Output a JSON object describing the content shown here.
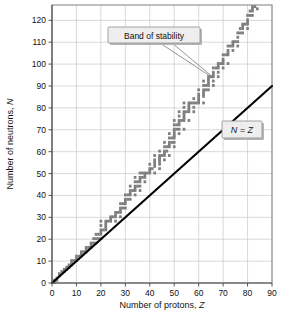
{
  "figure": {
    "background_color": "#ffffff",
    "plot_area": {
      "left": 52,
      "top": 5,
      "right": 272,
      "bottom": 283
    }
  },
  "chart_data": {
    "type": "scatter",
    "title": "",
    "xlabel_prefix": "Number of protons, ",
    "xlabel_symbol": "Z",
    "ylabel_prefix": "Number of neutrons, ",
    "ylabel_symbol": "N",
    "xlim": [
      0,
      90
    ],
    "ylim": [
      0,
      127
    ],
    "xticks": [
      0,
      10,
      20,
      30,
      40,
      50,
      60,
      70,
      80,
      90
    ],
    "yticks": [
      0,
      10,
      20,
      30,
      40,
      50,
      60,
      70,
      80,
      90,
      100,
      110,
      120
    ],
    "xtick_labels": [
      "0",
      "10",
      "20",
      "30",
      "40",
      "50",
      "60",
      "70",
      "80",
      "90"
    ],
    "ytick_labels": [
      "0",
      "10",
      "20",
      "30",
      "40",
      "50",
      "60",
      "70",
      "80",
      "90",
      "100",
      "110",
      "120"
    ],
    "grid": true,
    "grid_color": "#c9c9c9",
    "legend_position": "none",
    "annotations": [
      {
        "name": "band-of-stability-callout",
        "text": "Band of stability",
        "box_x": 108,
        "box_y": 27,
        "box_w": 92,
        "box_h": 16,
        "leader_from_x": 165,
        "leader_from_y": 43,
        "leader_to_x": 212,
        "leader_to_y": 77
      },
      {
        "name": "n-equals-z-label",
        "text": "N = Z",
        "box_x": 222,
        "box_y": 121,
        "box_w": 40,
        "box_h": 17
      }
    ],
    "series": [
      {
        "name": "N = Z line",
        "type": "line",
        "color": "#000000",
        "points": [
          [
            0,
            0
          ],
          [
            90,
            90
          ]
        ]
      },
      {
        "name": "Band of stability",
        "type": "scatter",
        "color": "#7f7f7f",
        "description": "Stable nuclides: central stepped band of (Z, N) pairs rising above the N=Z line as Z increases.",
        "points": [
          [
            1,
            0
          ],
          [
            1,
            1
          ],
          [
            2,
            1
          ],
          [
            2,
            2
          ],
          [
            3,
            3
          ],
          [
            3,
            4
          ],
          [
            4,
            5
          ],
          [
            5,
            5
          ],
          [
            5,
            6
          ],
          [
            6,
            6
          ],
          [
            6,
            7
          ],
          [
            7,
            7
          ],
          [
            7,
            8
          ],
          [
            8,
            8
          ],
          [
            8,
            9
          ],
          [
            8,
            10
          ],
          [
            9,
            10
          ],
          [
            10,
            10
          ],
          [
            10,
            11
          ],
          [
            10,
            12
          ],
          [
            11,
            12
          ],
          [
            12,
            12
          ],
          [
            12,
            13
          ],
          [
            12,
            14
          ],
          [
            13,
            14
          ],
          [
            14,
            14
          ],
          [
            14,
            15
          ],
          [
            14,
            16
          ],
          [
            15,
            16
          ],
          [
            16,
            16
          ],
          [
            16,
            17
          ],
          [
            16,
            18
          ],
          [
            17,
            18
          ],
          [
            17,
            20
          ],
          [
            18,
            18
          ],
          [
            18,
            20
          ],
          [
            18,
            22
          ],
          [
            19,
            20
          ],
          [
            19,
            22
          ],
          [
            20,
            20
          ],
          [
            20,
            22
          ],
          [
            20,
            23
          ],
          [
            20,
            24
          ],
          [
            20,
            26
          ],
          [
            20,
            28
          ],
          [
            21,
            24
          ],
          [
            22,
            24
          ],
          [
            22,
            25
          ],
          [
            22,
            26
          ],
          [
            22,
            27
          ],
          [
            22,
            28
          ],
          [
            23,
            28
          ],
          [
            24,
            28
          ],
          [
            24,
            29
          ],
          [
            24,
            30
          ],
          [
            25,
            30
          ],
          [
            26,
            28
          ],
          [
            26,
            30
          ],
          [
            26,
            31
          ],
          [
            26,
            32
          ],
          [
            27,
            32
          ],
          [
            28,
            30
          ],
          [
            28,
            32
          ],
          [
            28,
            33
          ],
          [
            28,
            34
          ],
          [
            28,
            36
          ],
          [
            29,
            34
          ],
          [
            29,
            36
          ],
          [
            30,
            34
          ],
          [
            30,
            36
          ],
          [
            30,
            37
          ],
          [
            30,
            38
          ],
          [
            30,
            40
          ],
          [
            31,
            38
          ],
          [
            31,
            40
          ],
          [
            32,
            38
          ],
          [
            32,
            40
          ],
          [
            32,
            41
          ],
          [
            32,
            42
          ],
          [
            32,
            44
          ],
          [
            33,
            42
          ],
          [
            34,
            40
          ],
          [
            34,
            42
          ],
          [
            34,
            43
          ],
          [
            34,
            44
          ],
          [
            34,
            46
          ],
          [
            34,
            48
          ],
          [
            35,
            44
          ],
          [
            35,
            46
          ],
          [
            36,
            42
          ],
          [
            36,
            44
          ],
          [
            36,
            46
          ],
          [
            36,
            47
          ],
          [
            36,
            48
          ],
          [
            36,
            50
          ],
          [
            37,
            48
          ],
          [
            37,
            50
          ],
          [
            38,
            46
          ],
          [
            38,
            48
          ],
          [
            38,
            49
          ],
          [
            38,
            50
          ],
          [
            39,
            50
          ],
          [
            40,
            50
          ],
          [
            40,
            51
          ],
          [
            40,
            52
          ],
          [
            40,
            54
          ],
          [
            41,
            52
          ],
          [
            42,
            50
          ],
          [
            42,
            53
          ],
          [
            42,
            54
          ],
          [
            42,
            55
          ],
          [
            42,
            56
          ],
          [
            42,
            58
          ],
          [
            44,
            52
          ],
          [
            44,
            54
          ],
          [
            44,
            55
          ],
          [
            44,
            56
          ],
          [
            44,
            57
          ],
          [
            44,
            58
          ],
          [
            44,
            60
          ],
          [
            45,
            58
          ],
          [
            46,
            56
          ],
          [
            46,
            58
          ],
          [
            46,
            59
          ],
          [
            46,
            60
          ],
          [
            46,
            62
          ],
          [
            46,
            64
          ],
          [
            47,
            60
          ],
          [
            47,
            62
          ],
          [
            48,
            58
          ],
          [
            48,
            62
          ],
          [
            48,
            63
          ],
          [
            48,
            64
          ],
          [
            48,
            66
          ],
          [
            48,
            68
          ],
          [
            49,
            64
          ],
          [
            49,
            66
          ],
          [
            50,
            62
          ],
          [
            50,
            64
          ],
          [
            50,
            66
          ],
          [
            50,
            67
          ],
          [
            50,
            68
          ],
          [
            50,
            69
          ],
          [
            50,
            70
          ],
          [
            50,
            72
          ],
          [
            50,
            74
          ],
          [
            51,
            70
          ],
          [
            51,
            72
          ],
          [
            52,
            68
          ],
          [
            52,
            70
          ],
          [
            52,
            72
          ],
          [
            52,
            73
          ],
          [
            52,
            74
          ],
          [
            52,
            76
          ],
          [
            52,
            78
          ],
          [
            53,
            74
          ],
          [
            54,
            70
          ],
          [
            54,
            74
          ],
          [
            54,
            75
          ],
          [
            54,
            76
          ],
          [
            54,
            77
          ],
          [
            54,
            78
          ],
          [
            54,
            80
          ],
          [
            54,
            82
          ],
          [
            55,
            78
          ],
          [
            56,
            74
          ],
          [
            56,
            78
          ],
          [
            56,
            79
          ],
          [
            56,
            80
          ],
          [
            56,
            81
          ],
          [
            56,
            82
          ],
          [
            57,
            82
          ],
          [
            58,
            78
          ],
          [
            58,
            80
          ],
          [
            58,
            82
          ],
          [
            58,
            84
          ],
          [
            59,
            82
          ],
          [
            60,
            82
          ],
          [
            60,
            83
          ],
          [
            60,
            84
          ],
          [
            60,
            85
          ],
          [
            60,
            86
          ],
          [
            60,
            88
          ],
          [
            62,
            82
          ],
          [
            62,
            85
          ],
          [
            62,
            86
          ],
          [
            62,
            87
          ],
          [
            62,
            88
          ],
          [
            62,
            90
          ],
          [
            62,
            92
          ],
          [
            63,
            88
          ],
          [
            63,
            90
          ],
          [
            64,
            88
          ],
          [
            64,
            90
          ],
          [
            64,
            91
          ],
          [
            64,
            92
          ],
          [
            64,
            93
          ],
          [
            64,
            94
          ],
          [
            65,
            94
          ],
          [
            66,
            90
          ],
          [
            66,
            92
          ],
          [
            66,
            94
          ],
          [
            66,
            95
          ],
          [
            66,
            96
          ],
          [
            66,
            98
          ],
          [
            67,
            98
          ],
          [
            68,
            94
          ],
          [
            68,
            96
          ],
          [
            68,
            98
          ],
          [
            68,
            99
          ],
          [
            68,
            100
          ],
          [
            69,
            100
          ],
          [
            70,
            98
          ],
          [
            70,
            100
          ],
          [
            70,
            101
          ],
          [
            70,
            102
          ],
          [
            70,
            104
          ],
          [
            71,
            104
          ],
          [
            72,
            100
          ],
          [
            72,
            104
          ],
          [
            72,
            105
          ],
          [
            72,
            106
          ],
          [
            72,
            108
          ],
          [
            73,
            108
          ],
          [
            74,
            106
          ],
          [
            74,
            108
          ],
          [
            74,
            109
          ],
          [
            74,
            110
          ],
          [
            75,
            110
          ],
          [
            76,
            108
          ],
          [
            76,
            110
          ],
          [
            76,
            112
          ],
          [
            76,
            114
          ],
          [
            77,
            114
          ],
          [
            77,
            116
          ],
          [
            78,
            114
          ],
          [
            78,
            116
          ],
          [
            78,
            117
          ],
          [
            78,
            118
          ],
          [
            79,
            118
          ],
          [
            80,
            116
          ],
          [
            80,
            118
          ],
          [
            80,
            119
          ],
          [
            80,
            120
          ],
          [
            80,
            122
          ],
          [
            81,
            122
          ],
          [
            81,
            124
          ],
          [
            82,
            122
          ],
          [
            82,
            124
          ],
          [
            82,
            125
          ],
          [
            82,
            126
          ],
          [
            83,
            126
          ],
          [
            84,
            125
          ]
        ]
      }
    ]
  }
}
